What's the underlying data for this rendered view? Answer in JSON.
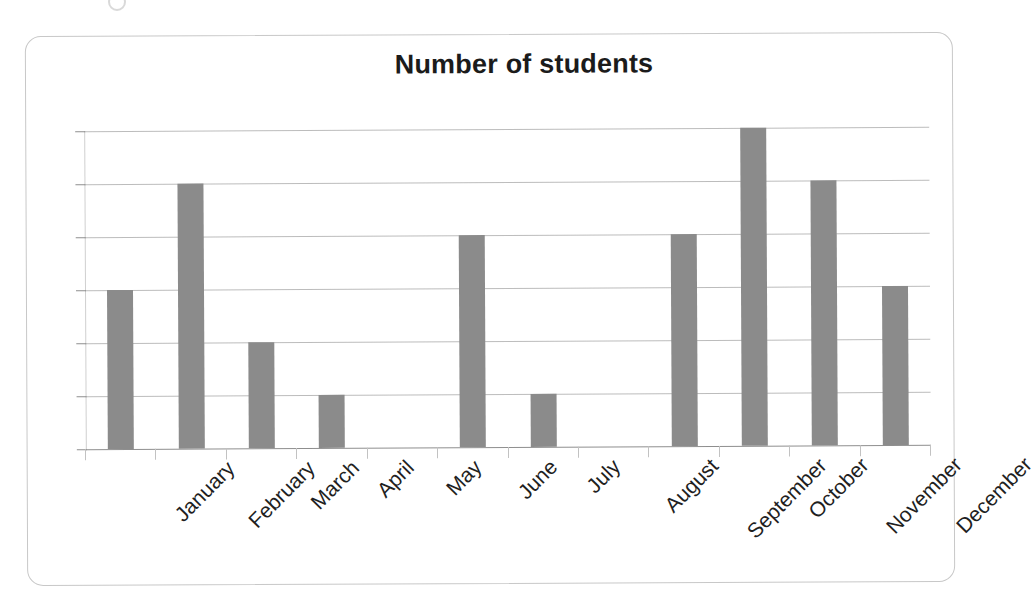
{
  "chart_data": {
    "type": "bar",
    "title": "Number of students",
    "xlabel": "",
    "ylabel": "",
    "categories": [
      "January",
      "February",
      "March",
      "April",
      "May",
      "June",
      "July",
      "August",
      "September",
      "October",
      "November",
      "December"
    ],
    "values": [
      3,
      5,
      2,
      1,
      0,
      4,
      1,
      0,
      4,
      6,
      5,
      3
    ],
    "ylim": [
      0,
      6
    ],
    "yticks": [
      "0",
      "1",
      "2",
      "3",
      "4",
      "5",
      "6"
    ],
    "ytick_values": [
      0,
      1,
      2,
      3,
      4,
      5,
      6
    ],
    "grid": true,
    "legend": false,
    "series": [
      {
        "name": "Number of students",
        "values": [
          3,
          5,
          2,
          1,
          0,
          4,
          1,
          0,
          4,
          6,
          5,
          3
        ]
      }
    ],
    "bar_color": "#8b8b8b",
    "gridline_color": "#b0b0b0",
    "axis_color": "#8e8e8e",
    "title_color": "#1b1b1b",
    "frame_color": "#c8c8c8",
    "background_color": "#ffffff",
    "xtick_label_rotation": -45
  }
}
